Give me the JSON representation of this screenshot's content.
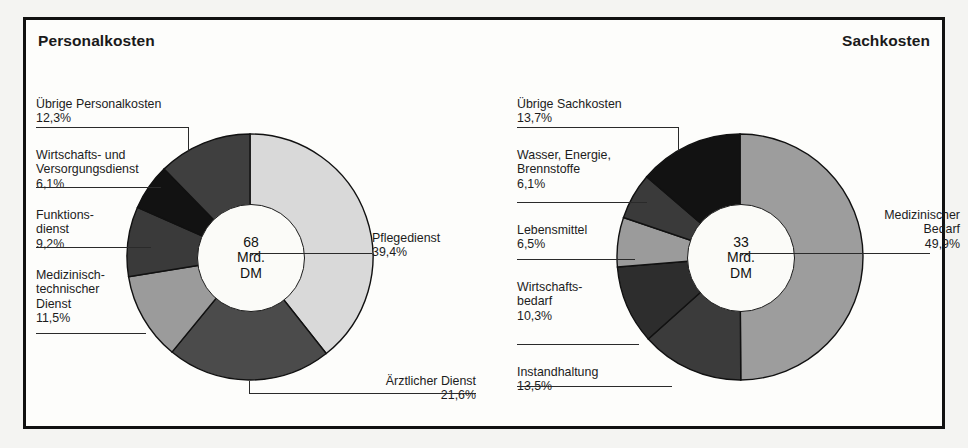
{
  "figure": {
    "background": "#f4f4f2",
    "frame_color": "#111111"
  },
  "panels": [
    {
      "id": "personalkosten",
      "title": "Personalkosten",
      "center_value": "68",
      "center_unit": "Mrd.",
      "center_currency": "DM"
    },
    {
      "id": "sachkosten",
      "title": "Sachkosten",
      "center_value": "33",
      "center_unit": "Mrd.",
      "center_currency": "DM"
    }
  ],
  "labels": {
    "p0": {
      "name": "Übrige Personalkosten",
      "pct": "12,3%"
    },
    "p1": {
      "name": "Wirtschafts- und\nVersorgungsdienst",
      "pct": "6,1%"
    },
    "p2": {
      "name": "Funktions-\ndienst",
      "pct": "9,2%"
    },
    "p3": {
      "name": "Medizinisch-\ntechnischer\nDienst",
      "pct": "11,5%"
    },
    "p4": {
      "name": "Pflegedienst",
      "pct": "39,4%"
    },
    "p5": {
      "name": "Ärztlicher Dienst",
      "pct": "21,6%"
    },
    "s0": {
      "name": "Übrige Sachkosten",
      "pct": "13,7%"
    },
    "s1": {
      "name": "Wasser, Energie,\nBrennstoffe",
      "pct": "6,1%"
    },
    "s2": {
      "name": "Lebensmittel",
      "pct": "6,5%"
    },
    "s3": {
      "name": "Wirtschafts-\nbedarf",
      "pct": "10,3%"
    },
    "s4": {
      "name": "Instandhaltung",
      "pct": "13,5%"
    },
    "s5": {
      "name": "Medizinischer\nBedarf",
      "pct": "49,9%"
    }
  },
  "chart_data": [
    {
      "type": "pie",
      "title": "Personalkosten",
      "subtitle": "68 Mrd. DM",
      "total_label": "68 Mrd. DM",
      "unit": "percent",
      "donut": true,
      "start_angle_deg": 0,
      "direction": "clockwise",
      "categories": [
        "Pflegedienst",
        "Ärztlicher Dienst",
        "Medizinisch-technischer Dienst",
        "Funktionsdienst",
        "Wirtschafts- und Versorgungsdienst",
        "Übrige Personalkosten"
      ],
      "values": [
        39.4,
        21.6,
        11.5,
        9.2,
        6.1,
        12.3
      ],
      "value_labels": [
        "39,4%",
        "21,6%",
        "11,5%",
        "9,2%",
        "6,1%",
        "12,3%"
      ],
      "colors": [
        "#d9d9d9",
        "#4b4b4b",
        "#9b9b9b",
        "#3a3a3a",
        "#121212",
        "#3f3f3f"
      ],
      "legend": "callout-labels"
    },
    {
      "type": "pie",
      "title": "Sachkosten",
      "subtitle": "33 Mrd. DM",
      "total_label": "33 Mrd. DM",
      "unit": "percent",
      "donut": true,
      "start_angle_deg": 0,
      "direction": "clockwise",
      "categories": [
        "Medizinischer Bedarf",
        "Instandhaltung",
        "Wirtschaftsbedarf",
        "Lebensmittel",
        "Wasser, Energie, Brennstoffe",
        "Übrige Sachkosten"
      ],
      "values": [
        49.9,
        13.5,
        10.3,
        6.5,
        6.1,
        13.7
      ],
      "value_labels": [
        "49,9%",
        "13,5%",
        "10,3%",
        "6,5%",
        "6,1%",
        "13,7%"
      ],
      "colors": [
        "#9d9d9d",
        "#3b3b3b",
        "#2d2d2d",
        "#9b9b9b",
        "#3a3a3a",
        "#121212"
      ],
      "legend": "callout-labels"
    }
  ]
}
